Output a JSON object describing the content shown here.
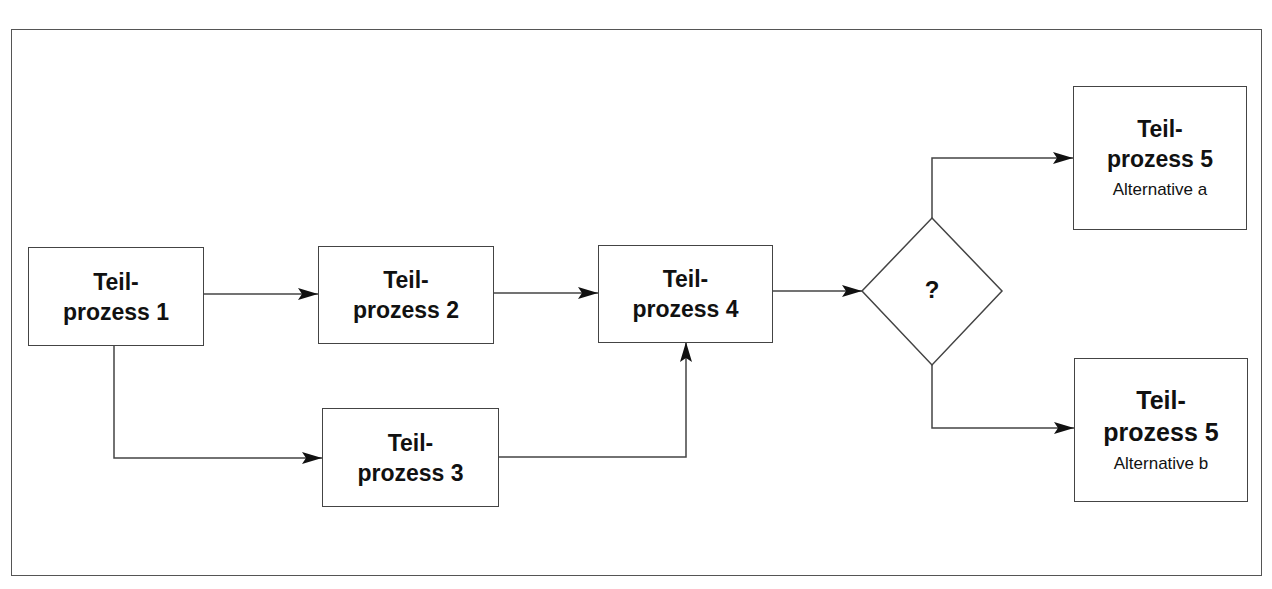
{
  "diagram": {
    "type": "flowchart",
    "nodes": [
      {
        "id": "p1",
        "line1": "Teil-",
        "line2": "prozess 1"
      },
      {
        "id": "p2",
        "line1": "Teil-",
        "line2": "prozess 2"
      },
      {
        "id": "p3",
        "line1": "Teil-",
        "line2": "prozess 3"
      },
      {
        "id": "p4",
        "line1": "Teil-",
        "line2": "prozess 4"
      },
      {
        "id": "decision",
        "label": "?"
      },
      {
        "id": "p5a",
        "line1": "Teil-",
        "line2": "prozess 5",
        "sub": "Alternative a"
      },
      {
        "id": "p5b",
        "line1": "Teil-",
        "line2": "prozess 5",
        "sub": "Alternative b"
      }
    ],
    "edges": [
      {
        "from": "p1",
        "to": "p2"
      },
      {
        "from": "p1",
        "to": "p3"
      },
      {
        "from": "p2",
        "to": "p4"
      },
      {
        "from": "p3",
        "to": "p4"
      },
      {
        "from": "p4",
        "to": "decision"
      },
      {
        "from": "decision",
        "to": "p5a"
      },
      {
        "from": "decision",
        "to": "p5b"
      }
    ],
    "colors": {
      "stroke": "#444444",
      "text": "#111111",
      "background": "#ffffff"
    }
  }
}
